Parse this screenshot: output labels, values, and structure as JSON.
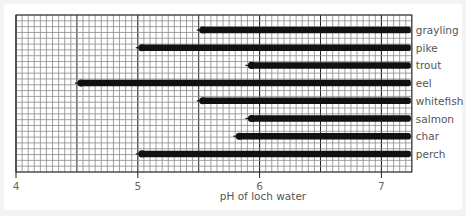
{
  "chart_data": {
    "type": "bar",
    "orientation": "horizontal-range",
    "title": "",
    "xlabel": "pH of loch water",
    "ylabel": "",
    "xlim": [
      4,
      7.25
    ],
    "xticks": [
      4,
      5,
      6,
      7
    ],
    "grid": true,
    "legend": null,
    "categories": [
      "grayling",
      "pike",
      "trout",
      "eel",
      "whitefish",
      "salmon",
      "char",
      "perch"
    ],
    "series": [
      {
        "name": "pH tolerance range",
        "start": [
          5.5,
          5.0,
          5.9,
          4.5,
          5.5,
          5.9,
          5.8,
          5.0
        ],
        "end": [
          7.25,
          7.25,
          7.25,
          7.25,
          7.25,
          7.25,
          7.25,
          7.25
        ]
      }
    ]
  },
  "colors": {
    "bar": "#111111",
    "grid_minor": "#8a8a8a",
    "grid_major": "#222222",
    "background": "#ffffff"
  }
}
